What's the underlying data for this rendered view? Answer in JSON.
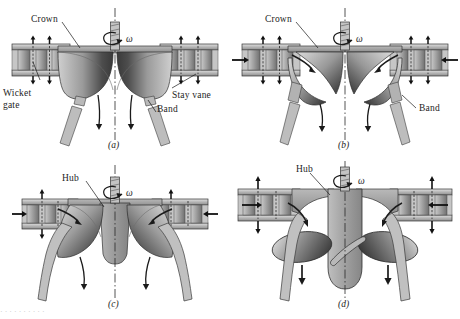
{
  "figure": {
    "panel_count": 4,
    "background_color": "#ffffff",
    "ink_color": "#1d1d1d",
    "metal_light": "#d9d9d9",
    "metal_mid": "#a8a8a8",
    "metal_dark": "#4a4a4a",
    "metal_shadow": "#2e2e2e"
  },
  "panels": [
    {
      "id": "a",
      "caption": "(a)",
      "runner_type": "radial-flow Francis runner",
      "labels": [
        {
          "name": "crown",
          "text": "Crown"
        },
        {
          "name": "wicket-gate",
          "text": "Wicket\ngate"
        },
        {
          "name": "wicket-gate-line1",
          "text": "Wicket"
        },
        {
          "name": "wicket-gate-line2",
          "text": "gate"
        },
        {
          "name": "stay-vane",
          "text": "Stay vane"
        },
        {
          "name": "band",
          "text": "Band"
        }
      ],
      "omega": "ω"
    },
    {
      "id": "b",
      "caption": "(b)",
      "runner_type": "mixed-flow Francis runner",
      "labels": [
        {
          "name": "crown",
          "text": "Crown"
        },
        {
          "name": "band",
          "text": "Band"
        }
      ],
      "omega": "ω"
    },
    {
      "id": "c",
      "caption": "(c)",
      "runner_type": "mixed-flow runner with hub",
      "labels": [
        {
          "name": "hub",
          "text": "Hub"
        }
      ],
      "omega": "ω"
    },
    {
      "id": "d",
      "caption": "(d)",
      "runner_type": "axial-flow propeller (Kaplan) runner",
      "labels": [
        {
          "name": "hub",
          "text": "Hub"
        }
      ],
      "omega": "ω"
    }
  ],
  "footer_bleed": "                                                   ·   ·    ·      ·             ·        ·      ·   ·        ·   ·"
}
